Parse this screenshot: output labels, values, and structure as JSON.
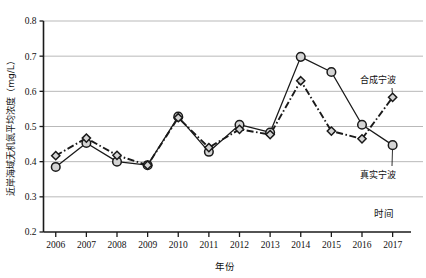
{
  "chart_data": {
    "type": "line",
    "title": "",
    "xlabel": "年份",
    "ylabel": "近岸海域无机氮平均浓度（mg/L）",
    "x_axis_annotation": "时间",
    "categories": [
      "2006",
      "2007",
      "2008",
      "2009",
      "2010",
      "2011",
      "2012",
      "2013",
      "2014",
      "2015",
      "2016",
      "2017"
    ],
    "xlim": [
      2005.6,
      2017.6
    ],
    "ylim": [
      0.2,
      0.8
    ],
    "yticks": [
      "0.2",
      "0.3",
      "0.4",
      "0.5",
      "0.6",
      "0.7",
      "0.8"
    ],
    "ytick_values": [
      0.2,
      0.3,
      0.4,
      0.5,
      0.6,
      0.7,
      0.8
    ],
    "grid": "horizontal",
    "legend_position": "right-inline",
    "series": [
      {
        "name": "真实宁波",
        "marker": "circle",
        "linestyle": "solid",
        "color": "#1a1a1a",
        "marker_fill": "#d4d4d4",
        "values": [
          0.385,
          0.453,
          0.4,
          0.39,
          0.528,
          0.428,
          0.505,
          0.483,
          0.698,
          0.655,
          0.505,
          0.447
        ]
      },
      {
        "name": "合成宁波",
        "marker": "diamond",
        "linestyle": "dash-dot",
        "color": "#1a1a1a",
        "marker_fill": "#d4d4d4",
        "values": [
          0.417,
          0.467,
          0.418,
          0.39,
          0.525,
          0.44,
          0.492,
          0.477,
          0.63,
          0.487,
          0.465,
          0.583
        ]
      }
    ],
    "annotations": [
      {
        "text": "合成宁波",
        "series": "合成宁波"
      },
      {
        "text": "真实宁波",
        "series": "真实宁波"
      },
      {
        "text": "时间",
        "role": "x-axis-end-label"
      }
    ]
  }
}
